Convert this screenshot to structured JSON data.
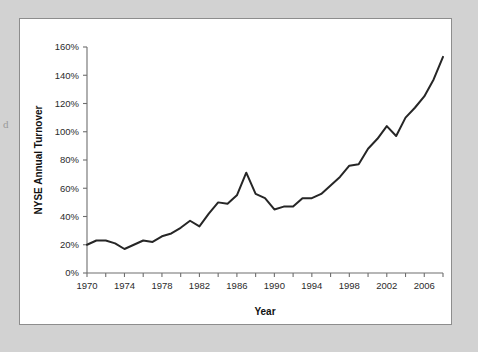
{
  "figure": {
    "page_bleed_text": "d",
    "background_color": "#d2d2d2",
    "panel_color": "#ffffff",
    "panel_border_color": "#8d8d8d"
  },
  "chart_data": {
    "type": "line",
    "title": "",
    "xlabel": "Year",
    "ylabel": "NYSE Annual Turnover",
    "xlim": [
      1970,
      2008
    ],
    "ylim": [
      0,
      160
    ],
    "grid": false,
    "legend": null,
    "line_color": "#262626",
    "axis_color": "#6e6e6e",
    "y_ticks": [
      0,
      20,
      40,
      60,
      80,
      100,
      120,
      140,
      160
    ],
    "y_tick_labels": [
      "0%",
      "20%",
      "40%",
      "60%",
      "80%",
      "100%",
      "120%",
      "140%",
      "160%"
    ],
    "x_ticks": [
      1970,
      1972,
      1974,
      1976,
      1978,
      1980,
      1982,
      1984,
      1986,
      1988,
      1990,
      1992,
      1994,
      1996,
      1998,
      2000,
      2002,
      2004,
      2006,
      2008
    ],
    "x_tick_labels": [
      "1970",
      "",
      "1974",
      "",
      "1978",
      "",
      "1982",
      "",
      "1986",
      "",
      "1990",
      "",
      "1994",
      "",
      "1998",
      "",
      "2002",
      "",
      "2006",
      ""
    ],
    "x": [
      1970,
      1971,
      1972,
      1973,
      1974,
      1975,
      1976,
      1977,
      1978,
      1979,
      1980,
      1981,
      1982,
      1983,
      1984,
      1985,
      1986,
      1987,
      1988,
      1989,
      1990,
      1991,
      1992,
      1993,
      1994,
      1995,
      1996,
      1997,
      1998,
      1999,
      2000,
      2001,
      2002,
      2003,
      2004,
      2005,
      2006,
      2007,
      2008
    ],
    "values": [
      20,
      23,
      23,
      21,
      17,
      20,
      23,
      22,
      26,
      28,
      32,
      37,
      33,
      42,
      50,
      49,
      55,
      71,
      56,
      53,
      45,
      47,
      47,
      53,
      53,
      56,
      62,
      68,
      76,
      77,
      88,
      95,
      104,
      97,
      110,
      117,
      125,
      137,
      153
    ],
    "series": [
      {
        "name": "NYSE Annual Turnover",
        "values": [
          20,
          23,
          23,
          21,
          17,
          20,
          23,
          22,
          26,
          28,
          32,
          37,
          33,
          42,
          50,
          49,
          55,
          71,
          56,
          53,
          45,
          47,
          47,
          53,
          53,
          56,
          62,
          68,
          76,
          77,
          88,
          95,
          104,
          97,
          110,
          117,
          125,
          137,
          153
        ]
      }
    ]
  }
}
